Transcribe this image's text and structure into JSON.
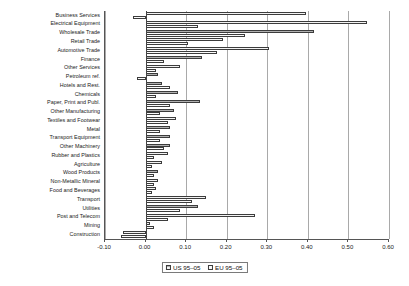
{
  "chart_data": {
    "type": "bar",
    "orientation": "horizontal",
    "title": "",
    "subtitle": "",
    "xlabel": "",
    "ylabel": "",
    "xlim": [
      -0.1,
      0.6
    ],
    "xticks": [
      "-0.10",
      "0.00",
      "0.10",
      "0.20",
      "0.30",
      "0.40",
      "0.50",
      "0.60"
    ],
    "xtick_values": [
      -0.1,
      0.0,
      0.1,
      0.2,
      0.3,
      0.4,
      0.5,
      0.6
    ],
    "grid": true,
    "legend_position": "bottom",
    "categories": [
      "Business Services",
      "Electrical Equipment",
      "Wholesale Trade",
      "Retail Trade",
      "Automotive Trade",
      "Finance",
      "Other Services",
      "Petroleum ref.",
      "Hotels and Rest.",
      "Chemicals",
      "Paper, Print and Publ.",
      "Other Manufacturing",
      "Textiles and Footwear",
      "Metal",
      "Transport Equipment",
      "Other Machinery",
      "Rubber and Plastics",
      "Agriculture",
      "Wood Products",
      "Non-Metallic Mineral",
      "Food and Beverages",
      "Transport",
      "Utilities",
      "Post and Telecom",
      "Mining",
      "Construction"
    ],
    "series": [
      {
        "name": "US 95–05",
        "color": "#b0b0b0",
        "values": [
          0.395,
          0.545,
          0.415,
          0.19,
          0.305,
          0.14,
          0.085,
          0.03,
          0.04,
          0.08,
          0.135,
          0.07,
          0.075,
          0.06,
          0.06,
          0.06,
          0.055,
          0.04,
          0.03,
          0.03,
          0.025,
          0.15,
          0.13,
          0.27,
          0.01,
          -0.055
        ]
      },
      {
        "name": "EU 95–05",
        "color": "#fbfbfb",
        "values": [
          -0.03,
          0.13,
          0.245,
          0.105,
          0.175,
          0.045,
          0.025,
          -0.02,
          0.06,
          0.025,
          0.06,
          0.035,
          0.055,
          0.035,
          0.035,
          0.045,
          0.02,
          0.015,
          0.02,
          0.02,
          0.015,
          0.115,
          0.085,
          0.055,
          0.02,
          -0.06
        ]
      }
    ]
  }
}
